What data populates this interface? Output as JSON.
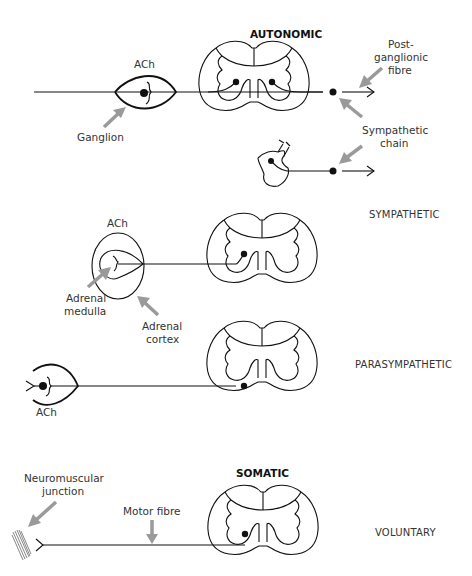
{
  "headers": {
    "autonomic": "AUTONOMIC",
    "somatic": "SOMATIC"
  },
  "sections": {
    "sympathetic": "SYMPATHETIC",
    "parasympathetic": "PARASYMPATHETIC",
    "voluntary": "VOLUNTARY"
  },
  "labels": {
    "ach_top": "ACh",
    "ganglion": "Ganglion",
    "post_ganglionic_1": "Post-",
    "post_ganglionic_2": "ganglionic",
    "post_ganglionic_3": "fibre",
    "sympathetic_chain_1": "Sympathetic",
    "sympathetic_chain_2": "chain",
    "ach_adrenal": "ACh",
    "adrenal_medulla_1": "Adrenal",
    "adrenal_medulla_2": "medulla",
    "adrenal_cortex_1": "Adrenal",
    "adrenal_cortex_2": "cortex",
    "ach_para": "ACh",
    "neuromuscular_1": "Neuromuscular",
    "neuromuscular_2": "junction",
    "motor_fibre": "Motor fibre"
  },
  "colors": {
    "line": "#111111",
    "arrow": "#9a9a9a",
    "text": "#333333"
  }
}
